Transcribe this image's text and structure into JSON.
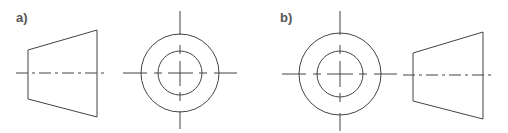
{
  "figure": {
    "panels": [
      {
        "label": "a)",
        "views": [
          "side-view-trapezoid",
          "end-view-concentric-circles"
        ]
      },
      {
        "label": "b)",
        "views": [
          "end-view-concentric-circles",
          "side-view-trapezoid"
        ]
      }
    ],
    "colors": {
      "line": "#444444",
      "label": "#555555",
      "background": "#ffffff"
    }
  }
}
